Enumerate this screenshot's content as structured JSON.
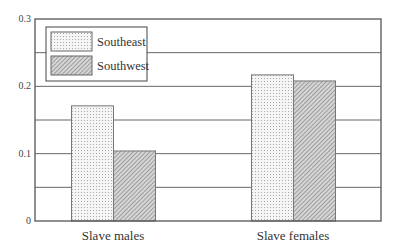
{
  "chart_data": {
    "type": "bar",
    "title": "",
    "xlabel": "",
    "ylabel": "",
    "categories": [
      "Slave males",
      "Slave females"
    ],
    "series": [
      {
        "name": "Southeast",
        "values": [
          0.171,
          0.217
        ],
        "pattern": "dots"
      },
      {
        "name": "Southwest",
        "values": [
          0.104,
          0.208
        ],
        "pattern": "hatch"
      }
    ],
    "ylim": [
      0,
      0.3
    ],
    "yticks": [
      0,
      0.1,
      0.2,
      0.3
    ],
    "ytick_labels": [
      "0",
      "0.1",
      "0.2",
      "0.3"
    ],
    "minor_gridlines": [
      0.05,
      0.15,
      0.25
    ],
    "grid": true,
    "legend_position": "upper left"
  },
  "colors": {
    "axis": "#555555",
    "grid": "#666666",
    "southeast_fill": "#f1f1f1",
    "southwest_fill": "#bdbdbd"
  }
}
